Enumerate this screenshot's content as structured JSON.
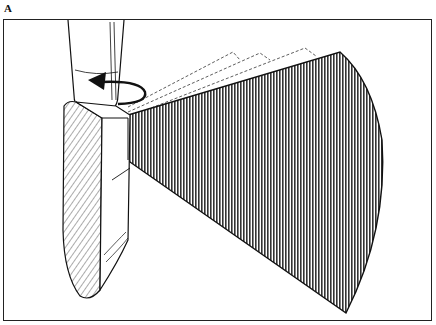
{
  "figure": {
    "panel_label": "A",
    "elements": [
      {
        "name": "transducer-probe",
        "description": "handheld probe with hatched side face"
      },
      {
        "name": "rotation-arrow",
        "description": "curved arrow around probe handle indicating rotation"
      },
      {
        "name": "sector-beam",
        "description": "vertically-striped fan-shaped scan plane"
      },
      {
        "name": "ghost-beam-outlines",
        "description": "dashed outlines showing previous beam positions"
      }
    ],
    "colors": {
      "line": "#111111",
      "background": "#ffffff",
      "hatch": "#555555"
    }
  }
}
